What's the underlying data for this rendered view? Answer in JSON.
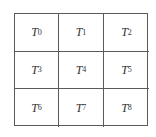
{
  "diagram": {
    "type": "3x3 grid",
    "rows": 3,
    "cols": 3,
    "cells": [
      {
        "base": "T",
        "sub": "0"
      },
      {
        "base": "T",
        "sub": "1"
      },
      {
        "base": "T",
        "sub": "2"
      },
      {
        "base": "T",
        "sub": "3"
      },
      {
        "base": "T",
        "sub": "4"
      },
      {
        "base": "T",
        "sub": "5"
      },
      {
        "base": "T",
        "sub": "6"
      },
      {
        "base": "T",
        "sub": "7"
      },
      {
        "base": "T",
        "sub": "8"
      }
    ],
    "line_color": "#5a5a5a",
    "text_color": "#333333"
  }
}
